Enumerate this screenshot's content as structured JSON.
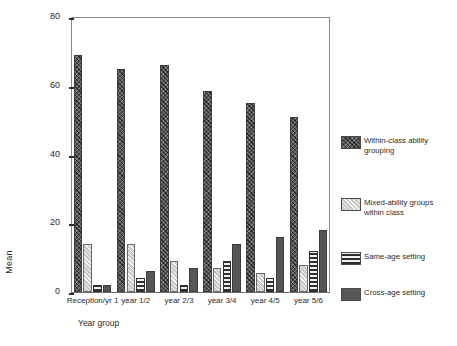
{
  "chart_data": {
    "type": "bar",
    "title": "",
    "subtitle": "",
    "xlabel": "Year group",
    "ylabel": "Mean",
    "ylim": [
      0,
      80
    ],
    "yticks": [
      0,
      20,
      40,
      60,
      80
    ],
    "grid": false,
    "legend_position": "right",
    "categories": [
      "Reception/yr 1",
      "year 1/2",
      "year 2/3",
      "year 3/4",
      "year 4/5",
      "year 5/6"
    ],
    "series": [
      {
        "name": "Within-class ability grouping",
        "pattern": "dark-crosshatch",
        "color": "#565656",
        "values": [
          69,
          65,
          66,
          58.5,
          55,
          51
        ]
      },
      {
        "name": "Mixed-ability groups within class",
        "pattern": "light-diagonal-hatch",
        "color": "#c9c9c9",
        "values": [
          14,
          14,
          9,
          7,
          5.5,
          8
        ]
      },
      {
        "name": "Same-age setting",
        "pattern": "horizontal-stripes",
        "color": "#2f2f2f",
        "values": [
          2,
          4,
          2,
          9,
          4,
          12
        ]
      },
      {
        "name": "Cross-age setting",
        "pattern": "solid-dark",
        "color": "#565656",
        "values": [
          2,
          6,
          7,
          14,
          16,
          18
        ]
      }
    ]
  },
  "legend": {
    "items": [
      {
        "label_line1": "Within-class ability",
        "label_line2": "grouping"
      },
      {
        "label_line1": "Mixed-ability groups",
        "label_line2": "within class"
      },
      {
        "label_line1": "Same-age setting",
        "label_line2": ""
      },
      {
        "label_line1": "Cross-age setting",
        "label_line2": ""
      }
    ]
  }
}
